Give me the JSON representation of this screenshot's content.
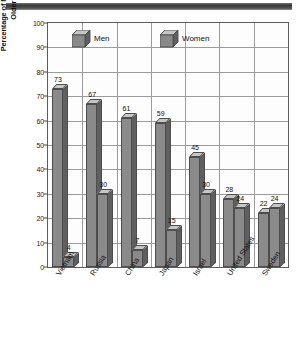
{
  "chart_data": {
    "type": "bar",
    "title": "",
    "subtitle": "",
    "xlabel": "",
    "ylabel": "Percentage of Men and Women Age Fifteen and Older Who Smoke Cigarettes",
    "ylabel_lines": [
      "Percentage of Men and Women Age Fifteen and",
      "Older Who Smoke Cigarettes"
    ],
    "categories": [
      "Vietnam",
      "Russia",
      "China",
      "Japan",
      "Israel",
      "United States",
      "Sweden"
    ],
    "series": [
      {
        "name": "Men",
        "values": [
          73,
          67,
          61,
          59,
          45,
          28,
          22
        ]
      },
      {
        "name": "Women",
        "values": [
          4,
          30,
          7,
          15,
          30,
          24,
          24
        ]
      }
    ],
    "ylim": [
      0,
      100
    ],
    "ytick_step": 10,
    "yticks": [
      "0",
      "10",
      "20",
      "30",
      "40",
      "50",
      "60",
      "70",
      "80",
      "90",
      "100"
    ],
    "grid": true,
    "legend_position": "inside-top",
    "legend": [
      {
        "label": "Men",
        "swatch": "cube-3d-icon"
      },
      {
        "label": "Women",
        "swatch": "cube-3d-icon"
      }
    ],
    "colors": {
      "bar_front": "#8a8a8a",
      "bar_top": "#c6c6c6",
      "bar_side": "#5f5f5f",
      "bar_outline": "#4d4d4d",
      "gridline": "#9b9b9b",
      "axis": "#5d5d5d",
      "text": "#151515",
      "background": "#ffffff"
    }
  }
}
